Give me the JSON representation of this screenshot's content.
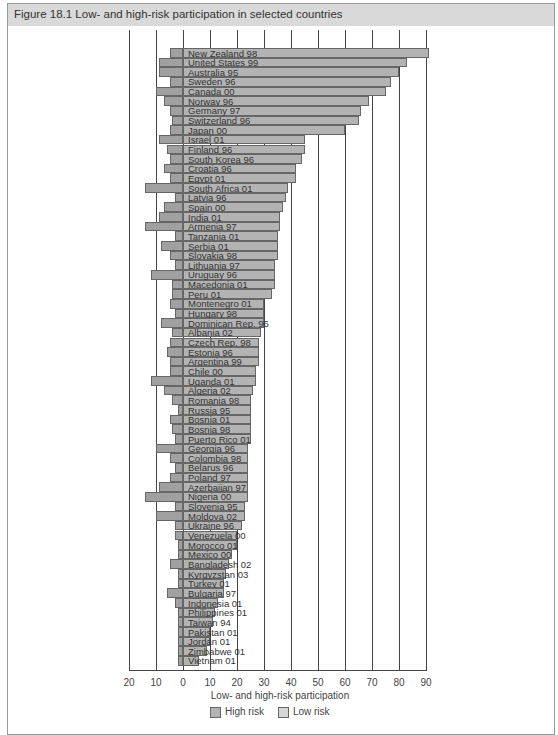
{
  "figure": {
    "title": "Figure 18.1  Low- and high-risk participation in selected countries"
  },
  "chart_data": {
    "type": "bar",
    "orientation": "horizontal",
    "title": "Low- and high-risk participation in selected countries",
    "xlabel": "Low- and high-risk participation",
    "ylabel": "",
    "x_ticks": [
      "20",
      "10",
      "0",
      "10",
      "20",
      "30",
      "40",
      "50",
      "60",
      "70",
      "80",
      "90"
    ],
    "xlim": [
      -20,
      90
    ],
    "grid": true,
    "legend": {
      "position": "bottom",
      "entries": [
        "High risk",
        "Low risk"
      ]
    },
    "categories": [
      "New Zealand 98",
      "United States 99",
      "Australia 95",
      "Sweden 96",
      "Canada 00",
      "Norway 96",
      "Germany 97",
      "Switzerland 96",
      "Japan 00",
      "Israel 01",
      "Finland 96",
      "South Korea 96",
      "Croatia 96",
      "Egypt 01",
      "South Africa 01",
      "Latvia 96",
      "Spain 00",
      "India 01",
      "Armenia 97",
      "Tanzania 01",
      "Serbia 01",
      "Slovakia 98",
      "Lithuania 97",
      "Uruguay 96",
      "Macedonia 01",
      "Peru 01",
      "Montenegro 01",
      "Hungary 98",
      "Dominican Rep. 96",
      "Albania 02",
      "Czech Rep. 98",
      "Estonia 96",
      "Argentina 99",
      "Chile 00",
      "Uganda 01",
      "Algeria 02",
      "Romania 98",
      "Russia 95",
      "Bosnia 01",
      "Bosnia 98",
      "Puerto Rico 01",
      "Georgia 96",
      "Colombia 98",
      "Belarus 96",
      "Poland 97",
      "Azerbaijan 97",
      "Nigeria 00",
      "Slovenia 95",
      "Moldova 02",
      "Ukraine 96",
      "Venezuela 00",
      "Morocco 01",
      "Mexico 00",
      "Bangladesh 02",
      "Kyrgyzstan 03",
      "Turkey 01",
      "Bulgaria 97",
      "Indonesia 01",
      "Philippines 01",
      "Taiwan 94",
      "Pakistan 01",
      "Jordan 01",
      "Zimbabwe 01",
      "Vietnam 01"
    ],
    "series": [
      {
        "name": "High risk",
        "values": [
          91,
          83,
          80,
          77,
          75,
          69,
          66,
          65,
          60,
          45,
          45,
          44,
          42,
          42,
          39,
          38,
          37,
          36,
          36,
          35,
          35,
          35,
          34,
          34,
          34,
          33,
          30,
          30,
          30,
          29,
          28,
          28,
          28,
          27,
          27,
          26,
          25,
          25,
          25,
          25,
          25,
          24,
          24,
          24,
          24,
          24,
          24,
          23,
          23,
          22,
          20,
          20,
          18,
          17,
          16,
          15,
          15,
          13,
          12,
          11,
          10,
          10,
          9,
          6
        ]
      },
      {
        "name": "Low risk",
        "values": [
          5,
          9,
          9,
          5,
          10,
          7,
          5,
          4,
          5,
          9,
          6,
          5,
          7,
          5,
          14,
          3,
          7,
          9,
          14,
          3,
          8,
          5,
          3,
          12,
          4,
          4,
          5,
          3,
          8,
          4,
          5,
          6,
          5,
          5,
          12,
          7,
          4,
          2,
          5,
          4,
          3,
          10,
          5,
          3,
          5,
          9,
          14,
          3,
          10,
          3,
          3,
          2,
          2,
          5,
          2,
          2,
          6,
          3,
          2,
          2,
          2,
          2,
          2,
          2
        ]
      }
    ]
  },
  "legend": {
    "high": "High risk",
    "low": "Low risk"
  },
  "colors": {
    "high": "#b3b3b3",
    "low": "#a0a0a0",
    "title_bar": "#d9d9d9"
  }
}
